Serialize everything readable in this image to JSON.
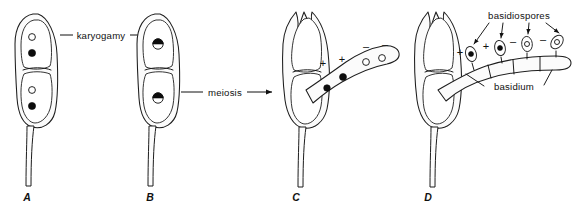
{
  "figure": {
    "background_color": "#ffffff",
    "ink_color": "#111111",
    "width": 575,
    "height": 215
  },
  "labels": {
    "karyogamy": "karyogamy",
    "meiosis": "meiosis",
    "basidiospores": "basidiospores",
    "basidium": "basidium"
  },
  "panels": [
    {
      "letter": "A",
      "name": "panel-a-dikaryotic-cells",
      "description": "Two dikaryotic cells, each containing one unfused light nucleus and one dark nucleus",
      "nuclei": [
        {
          "type": "light",
          "mating_type": ""
        },
        {
          "type": "dark",
          "mating_type": ""
        },
        {
          "type": "light",
          "mating_type": ""
        },
        {
          "type": "dark",
          "mating_type": ""
        }
      ]
    },
    {
      "letter": "B",
      "name": "panel-b-karyogamy-complete",
      "description": "Nuclei have fused; each cell shows a single half-dark half-light diploid nucleus",
      "nuclei": [
        {
          "type": "fused",
          "mating_type": ""
        },
        {
          "type": "fused",
          "mating_type": ""
        }
      ]
    },
    {
      "letter": "C",
      "name": "panel-c-meiosis-in-basidium",
      "description": "Young basidium extends from the upper cell; four haploid nuclei migrate into it",
      "nuclei": [
        {
          "type": "dark",
          "mating_type": "+"
        },
        {
          "type": "dark",
          "mating_type": "+"
        },
        {
          "type": "light",
          "mating_type": "-"
        },
        {
          "type": "light",
          "mating_type": "-"
        }
      ]
    },
    {
      "letter": "D",
      "name": "panel-d-basidiospores-formed",
      "description": "Four basidiospores borne on sterigmata at the tip of the basidium",
      "nuclei": [
        {
          "type": "dark",
          "mating_type": "+"
        },
        {
          "type": "dark",
          "mating_type": "+"
        },
        {
          "type": "light",
          "mating_type": "-"
        },
        {
          "type": "light",
          "mating_type": "-"
        }
      ]
    }
  ],
  "signs": {
    "plus": "+",
    "minus": "–"
  }
}
